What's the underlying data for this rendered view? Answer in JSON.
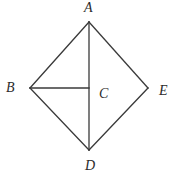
{
  "figure": {
    "background_color": "#ffffff",
    "stroke_color": "#3a3a3a",
    "label_color": "#2b2b2b",
    "stroke_width": 1.3,
    "width": 175,
    "height": 180,
    "points": {
      "A": {
        "label": "A",
        "x": 89,
        "y": 22
      },
      "B": {
        "label": "B",
        "x": 30,
        "y": 88
      },
      "C": {
        "label": "C",
        "x": 89,
        "y": 88
      },
      "D": {
        "label": "D",
        "x": 89,
        "y": 150
      },
      "E": {
        "label": "E",
        "x": 148,
        "y": 88
      }
    },
    "segments": [
      {
        "name": "segment-AB",
        "from": "A",
        "to": "B"
      },
      {
        "name": "segment-AE",
        "from": "A",
        "to": "E"
      },
      {
        "name": "segment-BD",
        "from": "B",
        "to": "D"
      },
      {
        "name": "segment-ED",
        "from": "E",
        "to": "D"
      },
      {
        "name": "segment-AD",
        "from": "A",
        "to": "D"
      },
      {
        "name": "segment-BC",
        "from": "B",
        "to": "C"
      }
    ]
  }
}
